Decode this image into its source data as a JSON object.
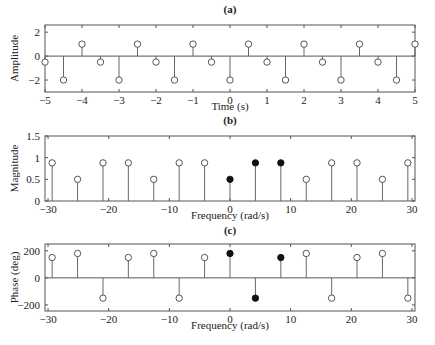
{
  "chart_data": [
    {
      "id": "a",
      "type": "stem",
      "title": "(a)",
      "xlabel": "Time (s)",
      "ylabel": "Amplitude",
      "xlim": [
        -5,
        5
      ],
      "ylim": [
        -3,
        2.6
      ],
      "xticks": [
        -5,
        -4,
        -3,
        -2,
        -1,
        0,
        1,
        2,
        3,
        4,
        5
      ],
      "yticks": [
        -2,
        0,
        2
      ],
      "grid": false,
      "box": {
        "left": 45,
        "right": 415,
        "top": 25,
        "bottom": 92
      },
      "title_y": 13,
      "xlabel_y": 110,
      "series": [
        {
          "name": "x(t) samples",
          "filled": false,
          "x": [
            -5,
            -4.5,
            -4,
            -3.5,
            -3,
            -2.5,
            -2,
            -1.5,
            -1,
            -0.5,
            0,
            0.5,
            1,
            1.5,
            2,
            2.5,
            3,
            3.5,
            4,
            4.5,
            5
          ],
          "y": [
            -0.5,
            -2,
            1,
            -0.5,
            -2,
            1,
            -0.5,
            -2,
            1,
            -0.5,
            -2,
            1,
            -0.5,
            -2,
            1,
            -0.5,
            -2,
            1,
            -0.5,
            -2,
            1
          ]
        }
      ]
    },
    {
      "id": "b",
      "type": "stem",
      "title": "(b)",
      "xlabel": "Frequency (rad/s)",
      "ylabel": "Magnitude",
      "xlim": [
        -30.5,
        30.5
      ],
      "ylim": [
        0,
        1.5
      ],
      "xticks": [
        -30,
        -20,
        -10,
        0,
        10,
        20,
        30
      ],
      "yticks": [
        0,
        0.5,
        1,
        1.5
      ],
      "grid": false,
      "box": {
        "left": 45,
        "right": 415,
        "top": 136,
        "bottom": 201
      },
      "title_y": 124,
      "xlabel_y": 219,
      "series": [
        {
          "name": "magnitude (other harmonics)",
          "filled": false,
          "x": [
            -29.32,
            -25.13,
            -20.94,
            -16.76,
            -12.57,
            -8.38,
            -4.19,
            12.57,
            16.76,
            20.94,
            25.13,
            29.32
          ],
          "y": [
            0.88,
            0.5,
            0.88,
            0.88,
            0.5,
            0.88,
            0.88,
            0.5,
            0.88,
            0.88,
            0.5,
            0.88
          ]
        },
        {
          "name": "magnitude (highlighted k=0,1,2)",
          "filled": true,
          "x": [
            0,
            4.19,
            8.38
          ],
          "y": [
            0.5,
            0.88,
            0.88
          ]
        }
      ]
    },
    {
      "id": "c",
      "type": "stem",
      "title": "(c)",
      "xlabel": "Frequency (rad/s)",
      "ylabel": "Phase (deg)",
      "xlim": [
        -30.5,
        30.5
      ],
      "ylim": [
        -245,
        250
      ],
      "xticks": [
        -30,
        -20,
        -10,
        0,
        10,
        20,
        30
      ],
      "yticks": [
        -200,
        0,
        200
      ],
      "grid": false,
      "box": {
        "left": 45,
        "right": 415,
        "top": 244,
        "bottom": 311
      },
      "title_y": 234,
      "xlabel_y": 329,
      "series": [
        {
          "name": "phase (other harmonics)",
          "filled": false,
          "x": [
            -29.32,
            -25.13,
            -20.94,
            -16.76,
            -12.57,
            -8.38,
            -4.19,
            12.57,
            16.76,
            20.94,
            25.13,
            29.32
          ],
          "y": [
            150,
            180,
            -150,
            150,
            180,
            -150,
            150,
            180,
            -150,
            150,
            180,
            -150
          ]
        },
        {
          "name": "phase (highlighted k=0,1,2)",
          "filled": true,
          "x": [
            0,
            4.19,
            8.38
          ],
          "y": [
            180,
            -150,
            150
          ]
        }
      ]
    }
  ],
  "style": {
    "axis_color": "#555555",
    "stem_color": "#666666",
    "marker_color": "#444444",
    "filled_color": "#111111"
  }
}
